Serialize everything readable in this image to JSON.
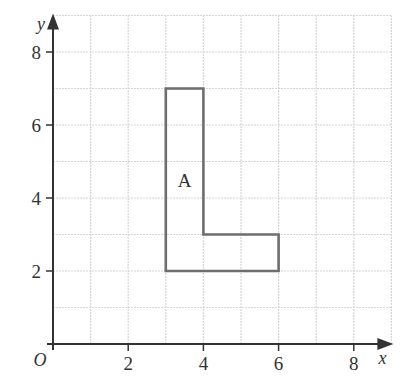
{
  "diagram": {
    "type": "coordinate-grid",
    "x_axis": {
      "label": "x",
      "min": 0,
      "max": 9,
      "tick_labels": [
        "2",
        "4",
        "6",
        "8"
      ],
      "tick_values": [
        2,
        4,
        6,
        8
      ]
    },
    "y_axis": {
      "label": "y",
      "min": 0,
      "max": 9,
      "tick_labels": [
        "2",
        "4",
        "6",
        "8"
      ],
      "tick_values": [
        2,
        4,
        6,
        8
      ]
    },
    "origin_label": "O",
    "grid": {
      "step": 1,
      "color": "#d6d6d6"
    },
    "shape": {
      "label": "A",
      "label_position": [
        3.5,
        4.5
      ],
      "vertices": [
        [
          3,
          2
        ],
        [
          3,
          7
        ],
        [
          4,
          7
        ],
        [
          4,
          3
        ],
        [
          6,
          3
        ],
        [
          6,
          2
        ]
      ],
      "stroke_color": "#6e6e6e"
    },
    "axis_color": "#333333"
  }
}
